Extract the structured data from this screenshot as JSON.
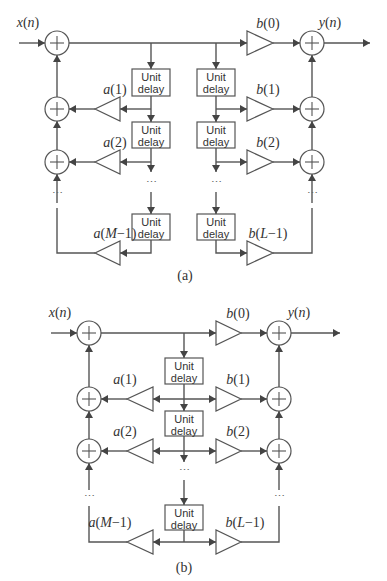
{
  "figure": {
    "diagram_a": {
      "caption": "(a)",
      "input_label": "x(n)",
      "output_label": "y(n)",
      "feedback_gains": [
        "a(1)",
        "a(2)",
        "a(M−1)"
      ],
      "feedforward_gains": [
        "b(0)",
        "b(1)",
        "b(2)",
        "b(L−1)"
      ],
      "delay_label_line1": "Unit",
      "delay_label_line2": "delay",
      "ellipsis": "⋯"
    },
    "diagram_b": {
      "caption": "(b)",
      "input_label": "x(n)",
      "output_label": "y(n)",
      "feedback_gains": [
        "a(1)",
        "a(2)",
        "a(M−1)"
      ],
      "feedforward_gains": [
        "b(0)",
        "b(1)",
        "b(2)",
        "b(L−1)"
      ],
      "delay_label_line1": "Unit",
      "delay_label_line2": "delay",
      "ellipsis": "⋯"
    }
  }
}
